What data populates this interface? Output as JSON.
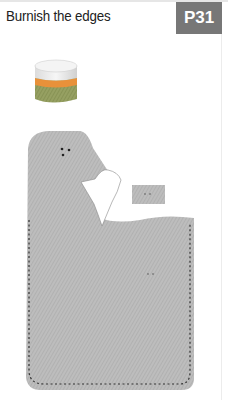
{
  "header": {
    "title": "Burnish the edges",
    "page_badge": "P31"
  },
  "illustration": {
    "items": [
      "burnishing-compound-jar",
      "leather-piece",
      "leather-tab"
    ],
    "colors": {
      "leather": "#b8b8b8",
      "stitch": "#333333",
      "badge": "#777777",
      "jar_lid": "#eeeeee",
      "jar_band": "#e8913a",
      "jar_body": "#8f9a5c"
    }
  }
}
